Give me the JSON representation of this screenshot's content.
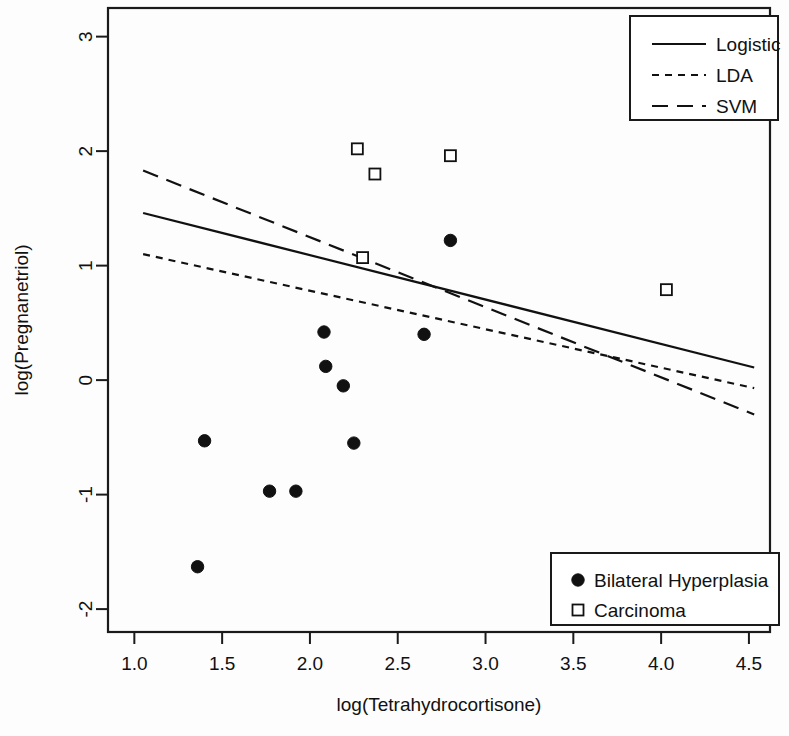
{
  "chart_data": {
    "type": "scatter",
    "title": "",
    "xlabel": "log(Tetrahydrocortisone)",
    "ylabel": "log(Pregnanetriol)",
    "xlim": [
      0.85,
      4.62
    ],
    "ylim": [
      -2.2,
      3.25
    ],
    "xticks": [
      1.0,
      1.5,
      2.0,
      2.5,
      3.0,
      3.5,
      4.0,
      4.5
    ],
    "xtick_labels": [
      "1.0",
      "1.5",
      "2.0",
      "2.5",
      "3.0",
      "3.5",
      "4.0",
      "4.5"
    ],
    "yticks": [
      -2,
      -1,
      0,
      1,
      2,
      3
    ],
    "ytick_labels": [
      "-2",
      "-1",
      "0",
      "1",
      "2",
      "3"
    ],
    "grid": false,
    "groups": [
      {
        "name": "Bilateral Hyperplasia",
        "marker": "filled-circle",
        "color": "#111111",
        "points": [
          {
            "x": 1.36,
            "y": -1.63
          },
          {
            "x": 1.4,
            "y": -0.53
          },
          {
            "x": 1.77,
            "y": -0.97
          },
          {
            "x": 1.92,
            "y": -0.97
          },
          {
            "x": 2.08,
            "y": 0.42
          },
          {
            "x": 2.09,
            "y": 0.12
          },
          {
            "x": 2.19,
            "y": -0.05
          },
          {
            "x": 2.25,
            "y": -0.55
          },
          {
            "x": 2.65,
            "y": 0.4
          },
          {
            "x": 2.8,
            "y": 1.22
          }
        ]
      },
      {
        "name": "Carcinoma",
        "marker": "open-square",
        "color": "#111111",
        "points": [
          {
            "x": 2.27,
            "y": 2.02
          },
          {
            "x": 2.3,
            "y": 1.07
          },
          {
            "x": 2.37,
            "y": 1.8
          },
          {
            "x": 2.8,
            "y": 1.96
          },
          {
            "x": 4.03,
            "y": 0.79
          }
        ]
      }
    ],
    "series": [
      {
        "name": "Logistic",
        "style": "solid",
        "x": [
          1.05,
          4.53
        ],
        "y": [
          1.46,
          0.11
        ]
      },
      {
        "name": "LDA",
        "style": "dotted",
        "x": [
          1.05,
          4.53
        ],
        "y": [
          1.1,
          -0.07
        ]
      },
      {
        "name": "SVM",
        "style": "dashed",
        "x": [
          1.05,
          4.53
        ],
        "y": [
          1.83,
          -0.3
        ]
      }
    ],
    "legend_lines_position": "top-right",
    "legend_groups_position": "bottom-right"
  },
  "legend_lines": {
    "items": [
      {
        "label": "Logistic",
        "style": "solid"
      },
      {
        "label": "LDA",
        "style": "dotted"
      },
      {
        "label": "SVM",
        "style": "dashed"
      }
    ]
  },
  "legend_groups": {
    "items": [
      {
        "label": "Bilateral Hyperplasia",
        "marker": "filled-circle"
      },
      {
        "label": "Carcinoma",
        "marker": "open-square"
      }
    ]
  },
  "axes": {
    "x_title": "log(Tetrahydrocortisone)",
    "y_title": "log(Pregnanetriol)"
  }
}
